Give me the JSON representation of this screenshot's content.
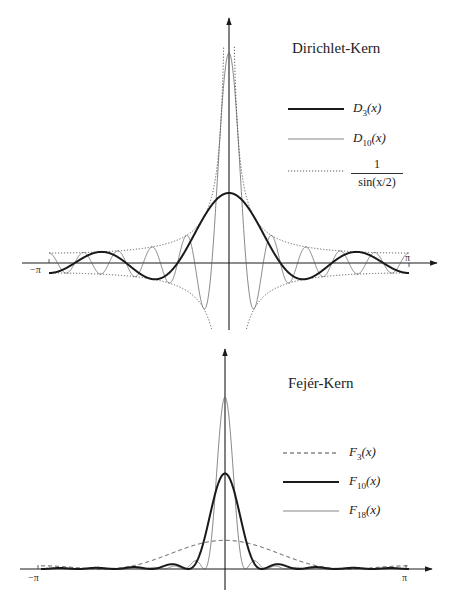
{
  "chart_data": [
    {
      "type": "line",
      "title": "Dirichlet-Kern",
      "xlabel": "",
      "ylabel": "",
      "xlim": [
        -3.1416,
        3.1416
      ],
      "ylim": [
        -7,
        21
      ],
      "x_ticks": [
        "-π",
        "π"
      ],
      "grid": false,
      "legend_position": "upper right",
      "series": [
        {
          "name": "D3(x)",
          "style": "thick solid",
          "formula": "sin(3.5x)/sin(x/2)",
          "peak_value": 7
        },
        {
          "name": "D10(x)",
          "style": "thin solid",
          "formula": "sin(10.5x)/sin(x/2)",
          "peak_value": 21
        },
        {
          "name": "1/sin(x/2)",
          "style": "dotted",
          "formula": "±1/sin(x/2)",
          "value_at_pi": 1
        }
      ],
      "sample_points": {
        "x": [
          -3.14,
          -2.36,
          -1.57,
          -0.79,
          0,
          0.79,
          1.57,
          2.36,
          3.14
        ],
        "D3": [
          -1.0,
          1.54,
          -1.0,
          -1.16,
          7.0,
          -1.16,
          -1.0,
          1.54,
          -1.0
        ],
        "D10": [
          -1.0,
          1.08,
          -1.41,
          0.0,
          21.0,
          0.0,
          -1.41,
          1.08,
          -1.0
        ],
        "envelope": [
          1.0,
          1.08,
          1.41,
          2.61,
          null,
          2.61,
          1.41,
          1.08,
          1.0
        ]
      }
    },
    {
      "type": "line",
      "title": "Fejér-Kern",
      "xlabel": "",
      "ylabel": "",
      "xlim": [
        -3.1416,
        3.1416
      ],
      "ylim": [
        0,
        18
      ],
      "x_ticks": [
        "-π",
        "π"
      ],
      "grid": false,
      "legend_position": "right",
      "series": [
        {
          "name": "F3(x)",
          "style": "dashed",
          "formula": "sin²(3x/2)/(3 sin²(x/2))",
          "peak_value": 3
        },
        {
          "name": "F10(x)",
          "style": "thick solid",
          "formula": "sin²(10x/2)/(10 sin²(x/2))",
          "peak_value": 10
        },
        {
          "name": "F18(x)",
          "style": "thin solid",
          "formula": "sin²(18x/2)/(18 sin²(x/2))",
          "peak_value": 18
        }
      ],
      "sample_points": {
        "x": [
          -3.14,
          -2.36,
          -1.57,
          -0.79,
          0,
          0.79,
          1.57,
          2.36,
          3.14
        ],
        "F3": [
          0.33,
          0.06,
          0.33,
          1.51,
          3.0,
          1.51,
          0.33,
          0.06,
          0.33
        ],
        "F10": [
          0.0,
          0.0,
          0.0,
          0.0,
          10.0,
          0.0,
          0.0,
          0.0,
          0.0
        ],
        "F18": [
          0.0,
          0.0,
          0.0,
          0.0,
          18.0,
          0.0,
          0.0,
          0.0,
          0.0
        ]
      }
    }
  ],
  "dirichlet": {
    "title": "Dirichlet-Kern",
    "legend": {
      "d3": {
        "sym": "D",
        "sub": "3",
        "arg": "(x)"
      },
      "d10": {
        "sym": "D",
        "sub": "10",
        "arg": "(x)"
      },
      "env": {
        "num": "1",
        "den": "sin(x/2)"
      }
    },
    "ticks": {
      "neg_pi": "−π",
      "pi": "π"
    }
  },
  "fejer": {
    "title": "Fejér-Kern",
    "legend": {
      "f3": {
        "sym": "F",
        "sub": "3",
        "arg": "(x)"
      },
      "f10": {
        "sym": "F",
        "sub": "10",
        "arg": "(x)"
      },
      "f18": {
        "sym": "F",
        "sub": "18",
        "arg": "(x)"
      }
    },
    "ticks": {
      "neg_pi": "−π",
      "pi": "π"
    }
  },
  "colors": {
    "ink": "#1a1a1a",
    "thin": "#555555",
    "paper": "#ffffff"
  }
}
